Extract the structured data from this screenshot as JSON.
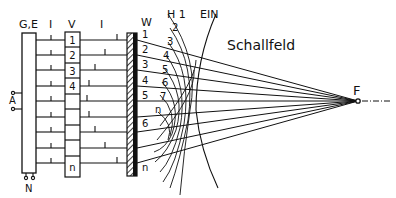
{
  "labels": {
    "ge": "G,E",
    "i1": "I",
    "v": "V",
    "i2": "I",
    "w": "W",
    "h1": "H 1",
    "ein": "EIN",
    "schallfeld": "Schallfeld",
    "f": "F",
    "a": "A",
    "n": "N"
  },
  "delay_cells": [
    "1",
    "2",
    "3",
    "4",
    "",
    "",
    "",
    "",
    "n"
  ],
  "wall_labels": [
    "1",
    "2",
    "3",
    "4",
    "5",
    "",
    "6",
    "",
    "n"
  ],
  "wavefront_labels": [
    "2",
    "3",
    "4",
    "5",
    "6",
    "7",
    "n"
  ],
  "colors": {
    "ink": "#111111",
    "background": "#ffffff"
  }
}
